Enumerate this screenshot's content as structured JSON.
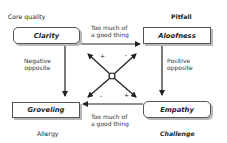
{
  "quadrants": {
    "top_left": {
      "category": "Core quality",
      "value": "Clarity",
      "box_shape": "rounded"
    },
    "top_right": {
      "category": "Pitfall",
      "value": "Aloofness",
      "box_shape": "square"
    },
    "bottom_left": {
      "category": "Allergy",
      "value": "Groveling",
      "box_shape": "square"
    },
    "bottom_right": {
      "category": "Challenge",
      "value": "Empathy",
      "box_shape": "rounded"
    }
  },
  "connectors": {
    "top": {
      "line1": "Too much of",
      "line2": "a good thing",
      "direction": "left-to-right"
    },
    "bottom": {
      "line1": "Too much of",
      "line2": "a good thing",
      "direction": "right-to-left"
    },
    "left": {
      "line1": "Negative",
      "line2": "opposite",
      "direction": "top-to-bottom"
    },
    "right": {
      "line1": "Positive",
      "line2": "opposite",
      "direction": "top-to-bottom"
    }
  },
  "center_cross": {
    "signs": {
      "top_left": "+",
      "top_right": "-",
      "bottom_left": "-",
      "bottom_right": "+"
    }
  },
  "colors": {
    "line": "#222222",
    "box_border": "#555555",
    "shadow": "#b8b8b8"
  }
}
